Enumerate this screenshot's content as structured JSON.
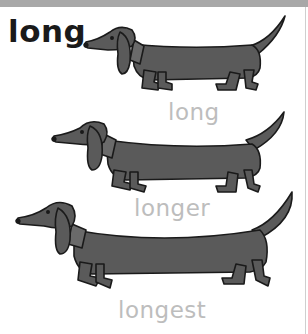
{
  "title": "long",
  "labels": [
    "long",
    "longer",
    "longest"
  ],
  "colors": {
    "dog_fill": "#5a5a5a",
    "outline": "#1a1a1a",
    "label": "#bdbdbd",
    "title": "#1a1a1a",
    "top_band": "#a8a8a8"
  },
  "illustrations": [
    {
      "name": "dachshund-1",
      "relative_length": "long"
    },
    {
      "name": "dachshund-2",
      "relative_length": "longer"
    },
    {
      "name": "dachshund-3",
      "relative_length": "longest"
    }
  ]
}
